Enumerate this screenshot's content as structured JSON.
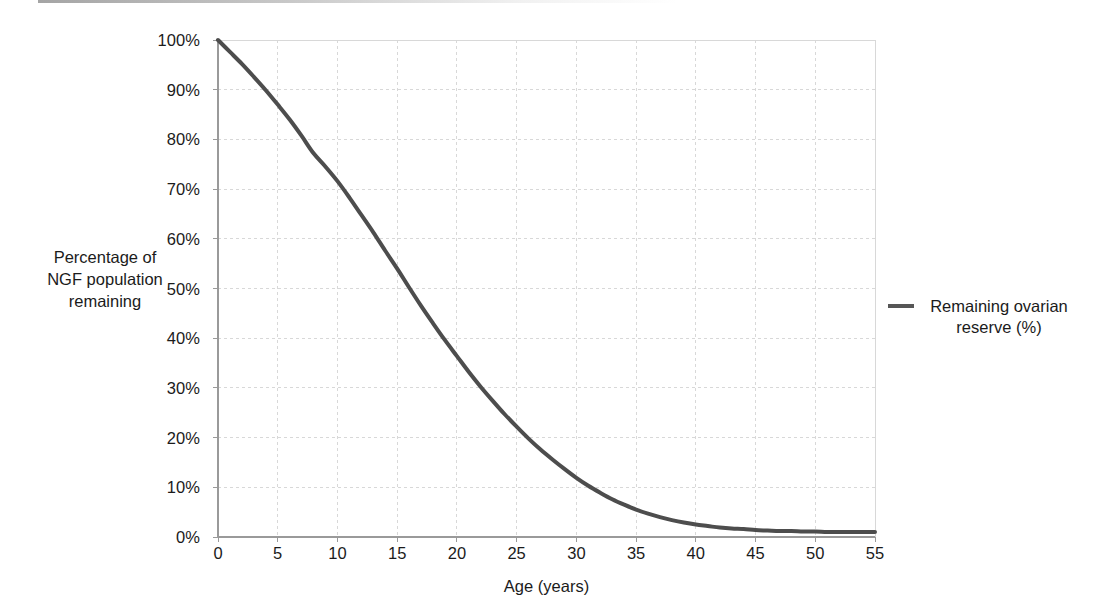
{
  "chart_data": {
    "type": "line",
    "title": "",
    "xlabel": "Age (years)",
    "ylabel": "Percentage of NGF population remaining",
    "ylabel_lines": [
      "Percentage of",
      "NGF population",
      "remaining"
    ],
    "xlim": [
      0,
      55
    ],
    "ylim": [
      0,
      100
    ],
    "xticks": [
      0,
      5,
      10,
      15,
      20,
      25,
      30,
      35,
      40,
      45,
      50,
      55
    ],
    "xtick_labels": [
      "0",
      "5",
      "10",
      "15",
      "20",
      "25",
      "30",
      "35",
      "40",
      "45",
      "50",
      "55"
    ],
    "yticks": [
      0,
      10,
      20,
      30,
      40,
      50,
      60,
      70,
      80,
      90,
      100
    ],
    "ytick_labels": [
      "0%",
      "10%",
      "20%",
      "30%",
      "40%",
      "50%",
      "60%",
      "70%",
      "80%",
      "90%",
      "100%"
    ],
    "grid": true,
    "legend_position": "right",
    "series": [
      {
        "name": "Remaining ovarian reserve (%)",
        "color": "#4d4d4d",
        "line_width": 4,
        "x": [
          0,
          1,
          2,
          3,
          4,
          5,
          6,
          7,
          8,
          9,
          10,
          11,
          12,
          13,
          14,
          15,
          16,
          17,
          18,
          19,
          20,
          21,
          22,
          23,
          24,
          25,
          26,
          27,
          28,
          29,
          30,
          31,
          32,
          33,
          34,
          35,
          36,
          37,
          38,
          39,
          40,
          41,
          42,
          43,
          44,
          45,
          46,
          47,
          48,
          49,
          50,
          51,
          52,
          53,
          54,
          55
        ],
        "values": [
          100.0,
          97.6,
          95.2,
          92.6,
          89.9,
          87.0,
          84.0,
          80.7,
          77.2,
          74.5,
          71.6,
          68.3,
          64.8,
          61.3,
          57.6,
          54.0,
          50.2,
          46.5,
          43.0,
          39.6,
          36.4,
          33.2,
          30.2,
          27.4,
          24.7,
          22.2,
          19.8,
          17.6,
          15.6,
          13.7,
          11.9,
          10.3,
          8.9,
          7.6,
          6.5,
          5.5,
          4.7,
          4.0,
          3.4,
          2.9,
          2.5,
          2.2,
          1.9,
          1.7,
          1.6,
          1.4,
          1.3,
          1.2,
          1.2,
          1.1,
          1.1,
          1.0,
          1.0,
          1.0,
          1.0,
          1.0
        ]
      }
    ]
  },
  "legend": {
    "entries": [
      {
        "label_line1": "Remaining ovarian",
        "label_line2": "reserve (%)",
        "color": "#565656"
      }
    ]
  },
  "colors": {
    "line": "#4d4d4d",
    "grid": "#d8d8d8",
    "axis": "#9a9a9a",
    "text": "#1b1b1b",
    "background": "#ffffff"
  }
}
